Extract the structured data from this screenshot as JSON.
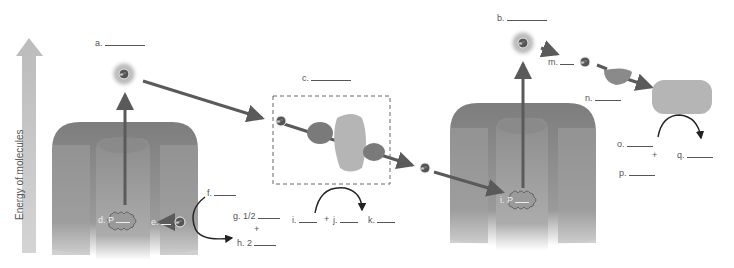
{
  "axis": {
    "label": "Energy of molecules"
  },
  "electron_symbol": "e⁻",
  "labels": {
    "a": "a.",
    "b": "b.",
    "c": "c.",
    "d": "d. P",
    "e": "e.",
    "f": "f.",
    "g_prefix": "g.",
    "g_fraction": "1/2",
    "plus_gh": "+",
    "h": "h. 2",
    "i": "i. P",
    "i_bottom": "i.",
    "plus_ij": "+",
    "j": "j.",
    "k": "k.",
    "m": "m.",
    "n": "n.",
    "o": "o.",
    "plus_op": "+",
    "p": "p.",
    "q": "q."
  },
  "colors": {
    "arrow": "#5a5a5a",
    "protein": "#8a8a8a",
    "energy_arrow": "#c8c8c8",
    "text": "#555555"
  }
}
